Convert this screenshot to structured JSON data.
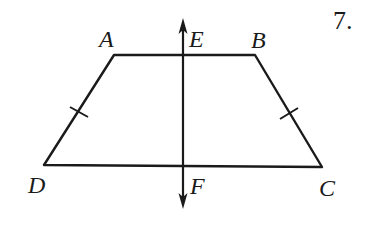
{
  "problem_number": "7.",
  "figure": {
    "shape": "isosceles trapezoid",
    "vertices": {
      "A": {
        "label": "A",
        "x": 114,
        "y": 55
      },
      "B": {
        "label": "B",
        "x": 255,
        "y": 55
      },
      "C": {
        "label": "C",
        "x": 322,
        "y": 167
      },
      "D": {
        "label": "D",
        "x": 44,
        "y": 165
      }
    },
    "line_of_symmetry": {
      "points": {
        "E": {
          "label": "E",
          "x": 183,
          "y": 55
        },
        "F": {
          "label": "F",
          "x": 183,
          "y": 166
        }
      },
      "arrow_top_y": 18,
      "arrow_bottom_y": 209
    },
    "congruence_marks": [
      {
        "segment": "AD",
        "x": 79,
        "y": 112
      },
      {
        "segment": "BC",
        "x": 289,
        "y": 113
      }
    ]
  },
  "labels": {
    "A": "A",
    "B": "B",
    "C": "C",
    "D": "D",
    "E": "E",
    "F": "F"
  }
}
